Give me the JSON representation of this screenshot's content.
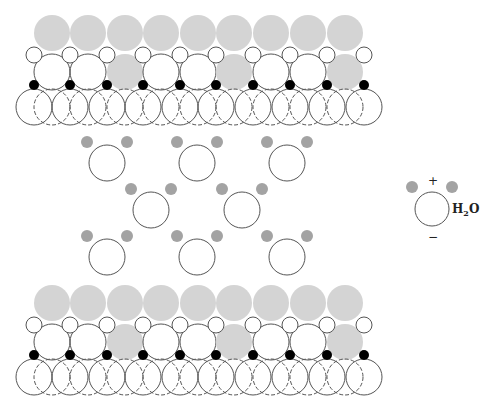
{
  "diagram": {
    "colors": {
      "outline": "#555555",
      "gray_atom": "#d4d4d4",
      "hydrogen": "#a3a3a3",
      "black_atom": "#000000",
      "white_atom": "#ffffff"
    },
    "surfaces": [
      {
        "name": "top-surface",
        "y_offset": 0
      },
      {
        "name": "bottom-surface",
        "y_offset": 270
      }
    ],
    "surface_layout": {
      "top_gray_row": {
        "y": 33,
        "r": 18,
        "x": [
          52,
          88,
          125,
          161,
          198,
          234,
          271,
          308,
          345
        ]
      },
      "small_white_row": {
        "y": 55,
        "r": 8,
        "x": [
          34,
          70,
          107,
          143,
          180,
          216,
          253,
          290,
          327,
          364
        ]
      },
      "big_mixed_row": {
        "y": 72,
        "r": 18,
        "x": [
          52,
          88,
          125,
          161,
          198,
          234,
          271,
          308,
          345
        ],
        "fills": [
          "white",
          "white",
          "gray",
          "white",
          "white",
          "gray",
          "white",
          "white",
          "gray"
        ]
      },
      "black_dot_row": {
        "y": 85,
        "r": 5,
        "x": [
          34,
          70,
          107,
          143,
          180,
          216,
          253,
          290,
          327,
          364
        ]
      },
      "bottom_dashed_row": {
        "y": 107,
        "r": 18,
        "x": [
          52,
          88,
          125,
          161,
          198,
          234,
          271,
          308,
          345
        ]
      },
      "bottom_solid_row": {
        "y": 107,
        "r": 18,
        "x": [
          34,
          70,
          107,
          143,
          180,
          216,
          253,
          290,
          327,
          364
        ]
      }
    },
    "water_molecules": [
      {
        "ox": 107,
        "oy": 163
      },
      {
        "ox": 197,
        "oy": 163
      },
      {
        "ox": 287,
        "oy": 163
      },
      {
        "ox": 151,
        "oy": 210
      },
      {
        "ox": 242,
        "oy": 210
      },
      {
        "ox": 107,
        "oy": 257
      },
      {
        "ox": 197,
        "oy": 257
      },
      {
        "ox": 287,
        "oy": 257
      }
    ],
    "water_geometry": {
      "o_r": 18,
      "h_r": 6,
      "h_dx": 20,
      "h_dy": -21
    }
  },
  "legend": {
    "label": "H",
    "subscript": "2",
    "label_tail": "O",
    "plus_sign": "+",
    "minus_sign": "−",
    "molecule": {
      "ox": 432,
      "oy": 209,
      "o_r": 17,
      "h_r": 6,
      "h_dx": 20,
      "h_dy": -22
    }
  }
}
